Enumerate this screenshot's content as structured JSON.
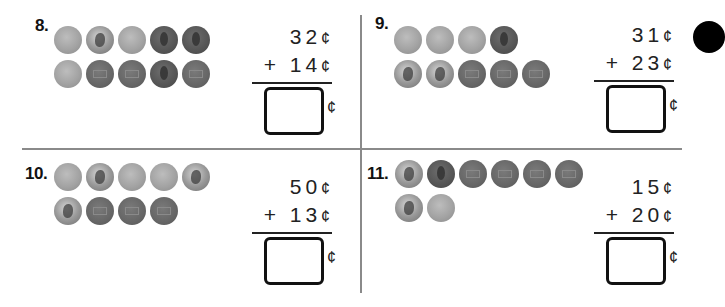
{
  "worksheet": {
    "problems": [
      {
        "number": "8.",
        "coin_rows": [
          [
            "nickel",
            "dime",
            "nickel",
            "penny-head",
            "penny-head"
          ],
          [
            "nickel",
            "penny-tail",
            "penny-tail",
            "penny-head",
            "penny-tail"
          ]
        ],
        "addend1": "32",
        "addend2": "+ 14",
        "cent_symbol": "¢",
        "answer": ""
      },
      {
        "number": "9.",
        "coin_rows": [
          [
            "nickel",
            "nickel",
            "nickel",
            "penny-head"
          ],
          [
            "dime",
            "dime",
            "penny-tail",
            "penny-tail",
            "penny-tail"
          ]
        ],
        "addend1": "31",
        "addend2": "+ 23",
        "cent_symbol": "¢",
        "answer": ""
      },
      {
        "number": "10.",
        "coin_rows": [
          [
            "nickel",
            "dime",
            "nickel",
            "nickel",
            "dime"
          ],
          [
            "dime",
            "penny-tail",
            "penny-tail",
            "penny-tail"
          ]
        ],
        "addend1": "50",
        "addend2": "+ 13",
        "cent_symbol": "¢",
        "answer": ""
      },
      {
        "number": "11.",
        "coin_rows": [
          [
            "dime",
            "penny-head",
            "penny-tail",
            "penny-tail",
            "penny-tail",
            "penny-tail"
          ],
          [
            "dime",
            "nickel"
          ]
        ],
        "addend1": "15",
        "addend2": "+ 20",
        "cent_symbol": "¢",
        "answer": ""
      }
    ]
  }
}
